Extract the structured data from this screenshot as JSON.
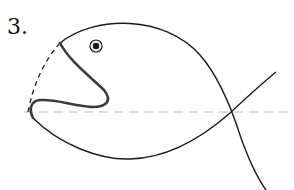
{
  "problem": {
    "number_label": "3."
  },
  "figure": {
    "colors": {
      "outline": "#1a1a1a",
      "mouth": "#3a3a3a",
      "dashed_arc": "#1a1a1a",
      "axis": "#bbbbbb",
      "background": "#ffffff"
    },
    "elements": [
      "eye",
      "mouth",
      "dashed-mouth-arc",
      "upper-body-curve",
      "lower-body-curve",
      "horizontal-dashed-axis"
    ]
  }
}
